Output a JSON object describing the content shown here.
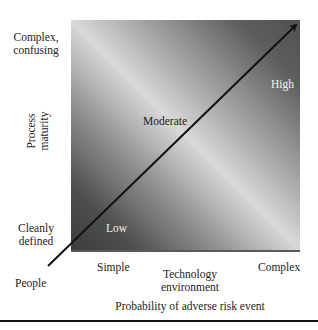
{
  "diagram": {
    "y_axis": {
      "title_line1": "Process",
      "title_line2": "maturity",
      "top_label_line1": "Complex,",
      "top_label_line2": "confusing",
      "bottom_label_line1": "Cleanly",
      "bottom_label_line2": "defined"
    },
    "x_axis": {
      "title_line1": "Technology",
      "title_line2": "environment",
      "left_label": "Simple",
      "right_label": "Complex"
    },
    "origin_label": "People",
    "zones": {
      "low": "Low",
      "moderate": "Moderate",
      "high": "High"
    },
    "arrow_caption": "Probability of adverse risk event",
    "colors": {
      "dark_corner": "#3c3c3c",
      "light_band": "#d9d9d9",
      "arrow": "#111111",
      "text": "#222222",
      "zone_text_light": "#f2f2f2"
    }
  }
}
